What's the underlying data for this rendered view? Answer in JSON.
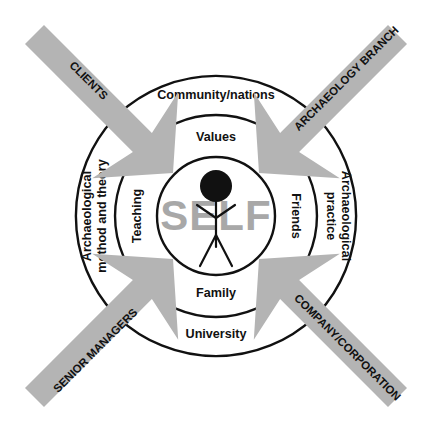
{
  "diagram": {
    "title": "SELF",
    "center": {
      "label": "SELF",
      "figure_icon": "person-stick-figure-icon",
      "label_color": "#a8a8a8"
    },
    "geometry": {
      "cx": 216,
      "cy": 216,
      "r_inner": 59,
      "r_middle": 101,
      "r_outer": 144
    },
    "colors": {
      "arrow_fill": "#b4b4b4",
      "stroke": "#111111",
      "background": "#ffffff",
      "self_text": "#a8a8a8"
    },
    "sectors": [
      {
        "position": "top",
        "inner_label": "Values",
        "outer_label": "Community/nations"
      },
      {
        "position": "right",
        "inner_label": "Friends",
        "outer_label": "Archaeological practice",
        "outer_label_line1": "Archaeological",
        "outer_label_line2": "practice"
      },
      {
        "position": "bottom",
        "inner_label": "Family",
        "outer_label": "University"
      },
      {
        "position": "left",
        "inner_label": "Teaching",
        "outer_label": "Archaeological method and theory",
        "outer_label_line1": "Archaeological",
        "outer_label_line2": "method and theory"
      }
    ],
    "arrows": [
      {
        "position": "top-left",
        "label": "CLIENTS"
      },
      {
        "position": "top-right",
        "label": "ARCHAEOLOGY BRANCH"
      },
      {
        "position": "bottom-left",
        "label": "SENIOR MANAGERS"
      },
      {
        "position": "bottom-right",
        "label": "COMPANY/CORPORATION"
      }
    ]
  }
}
